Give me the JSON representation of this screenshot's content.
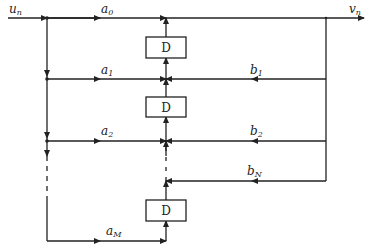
{
  "diagram": {
    "type": "block-diagram",
    "input_label": {
      "main": "u",
      "sub": "n"
    },
    "output_label": {
      "main": "v",
      "sub": "n"
    },
    "delay_label": "D",
    "feedforward_gains": [
      {
        "main": "a",
        "sub": "0"
      },
      {
        "main": "a",
        "sub": "1"
      },
      {
        "main": "a",
        "sub": "2"
      },
      {
        "main": "a",
        "sub": "M"
      }
    ],
    "feedback_gains": [
      {
        "main": "b",
        "sub": "1"
      },
      {
        "main": "b",
        "sub": "2"
      },
      {
        "main": "b",
        "sub": "N"
      }
    ],
    "delays": [
      {
        "label": "D"
      },
      {
        "label": "D"
      },
      {
        "label": "D"
      }
    ],
    "colors": {
      "line": "#222222",
      "background": "#ffffff"
    }
  }
}
